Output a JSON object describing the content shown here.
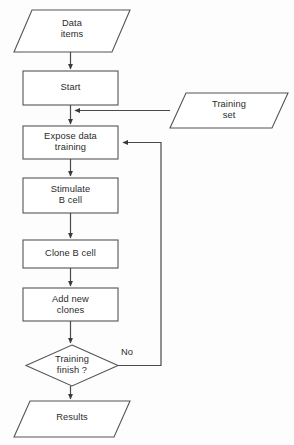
{
  "diagram": {
    "background_color": "#fdfdfd",
    "stroke_color": "#555555",
    "text_color": "#2b2b2b",
    "nodes": [
      {
        "id": "data-items",
        "shape": "parallelogram",
        "label": "Data\nitems",
        "x": 14,
        "y": 10,
        "w": 116,
        "h": 42,
        "skew": 18
      },
      {
        "id": "start",
        "shape": "process",
        "label": "Start",
        "x": 23,
        "y": 71,
        "w": 95,
        "h": 34
      },
      {
        "id": "training-set",
        "shape": "parallelogram",
        "label": "Training\nset",
        "x": 170,
        "y": 93,
        "w": 118,
        "h": 35,
        "skew": 16
      },
      {
        "id": "expose-data-training",
        "shape": "process",
        "label": "Expose data\ntraining",
        "x": 23,
        "y": 126,
        "w": 95,
        "h": 33
      },
      {
        "id": "stimulate-b-cell",
        "shape": "process",
        "label": "Stimulate\nB cell",
        "x": 23,
        "y": 178,
        "w": 95,
        "h": 35
      },
      {
        "id": "clone-b-cell",
        "shape": "process",
        "label": "Clone B cell",
        "x": 23,
        "y": 240,
        "w": 95,
        "h": 28
      },
      {
        "id": "add-new-clones",
        "shape": "process",
        "label": "Add new\nclones",
        "x": 23,
        "y": 288,
        "w": 95,
        "h": 33
      },
      {
        "id": "training-finish",
        "shape": "decision",
        "label": "Training\nfinish ?",
        "x": 26,
        "y": 345,
        "w": 92,
        "h": 41
      },
      {
        "id": "results",
        "shape": "parallelogram",
        "label": "Results",
        "x": 14,
        "y": 401,
        "w": 116,
        "h": 36,
        "skew": 16
      }
    ],
    "edges": [
      {
        "id": "data-items-to-start",
        "from": "data-items",
        "to": "start",
        "label": ""
      },
      {
        "id": "start-to-expose",
        "from": "start",
        "to": "expose-data-training",
        "label": ""
      },
      {
        "id": "training-set-to-main",
        "from": "training-set",
        "to": "start-expose-link",
        "label": ""
      },
      {
        "id": "expose-to-stimulate",
        "from": "expose-data-training",
        "to": "stimulate-b-cell",
        "label": ""
      },
      {
        "id": "stimulate-to-clone",
        "from": "stimulate-b-cell",
        "to": "clone-b-cell",
        "label": ""
      },
      {
        "id": "clone-to-add",
        "from": "clone-b-cell",
        "to": "add-new-clones",
        "label": ""
      },
      {
        "id": "add-to-decision",
        "from": "add-new-clones",
        "to": "training-finish",
        "label": ""
      },
      {
        "id": "decision-no-feedback",
        "from": "training-finish",
        "to": "expose-data-training",
        "label": "No"
      },
      {
        "id": "decision-to-results",
        "from": "training-finish",
        "to": "results",
        "label": ""
      }
    ],
    "edge_labels": {
      "no": "No"
    }
  }
}
